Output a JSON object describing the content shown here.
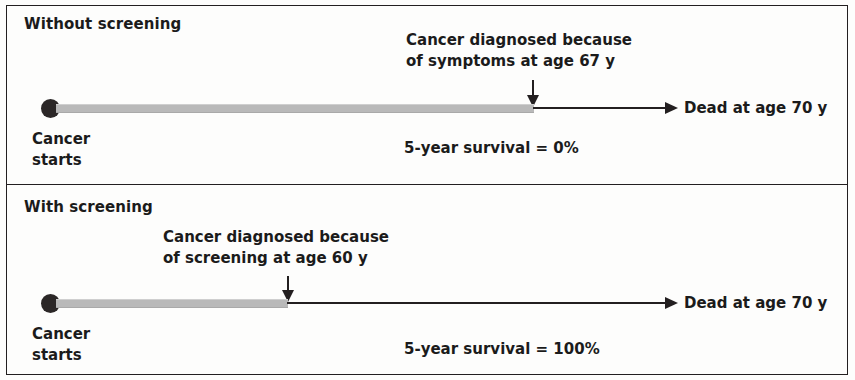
{
  "figure": {
    "type": "lead-time-bias-diagram",
    "panels": [
      {
        "id": "without-screening",
        "title": "Without screening",
        "start_label_line1": "Cancer",
        "start_label_line2": "starts",
        "diagnosis_annotation_line1": "Cancer diagnosed because",
        "diagnosis_annotation_line2": "of symptoms at age 67 y",
        "endpoint_label": "Dead at age 70 y",
        "survival_label": "5-year survival = 0%",
        "diagnosis_age_years": 67,
        "death_age_years": 70,
        "survival_percent": "0%"
      },
      {
        "id": "with-screening",
        "title": "With screening",
        "start_label_line1": "Cancer",
        "start_label_line2": "starts",
        "diagnosis_annotation_line1": "Cancer diagnosed because",
        "diagnosis_annotation_line2": "of screening at age 60 y",
        "endpoint_label": "Dead at age 70 y",
        "survival_label": "5-year survival = 100%",
        "diagnosis_age_years": 60,
        "death_age_years": 70,
        "survival_percent": "100%"
      }
    ],
    "colors": {
      "ink": "#231f20",
      "preclinical_bar": "#b9b9b9",
      "background": "#fdfdfc"
    }
  }
}
